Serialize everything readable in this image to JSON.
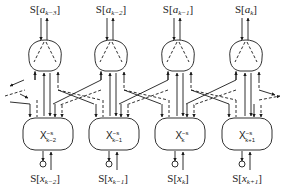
{
  "diagram": {
    "type": "factor-graph / message-passing chain",
    "top_nodes": [
      {
        "label_prefix": "S[",
        "var": "a",
        "sub": "k−3",
        "label_suffix": "]",
        "cx": 45
      },
      {
        "label_prefix": "S[",
        "var": "a",
        "sub": "k−2",
        "label_suffix": "]",
        "cx": 111
      },
      {
        "label_prefix": "S[",
        "var": "a",
        "sub": "k−1",
        "label_suffix": "]",
        "cx": 178
      },
      {
        "label_prefix": "S[",
        "var": "a",
        "sub": "k",
        "label_suffix": "]",
        "cx": 246
      }
    ],
    "bottom_nodes": [
      {
        "label_prefix": "S[",
        "var": "x",
        "sub": "k−2",
        "label_suffix": "]",
        "cx": 45,
        "box_main": "X",
        "box_sup": "−s",
        "box_sub": "k−2"
      },
      {
        "label_prefix": "S[",
        "var": "x",
        "sub": "k−1",
        "label_suffix": "]",
        "cx": 113,
        "box_main": "X",
        "box_sup": "−s",
        "box_sub": "k−1"
      },
      {
        "label_prefix": "S[",
        "var": "x",
        "sub": "k",
        "label_suffix": "]",
        "cx": 178,
        "box_main": "X",
        "box_sup": "−s",
        "box_sub": "k"
      },
      {
        "label_prefix": "S[",
        "var": "x",
        "sub": "k+1",
        "label_suffix": "]",
        "cx": 247,
        "box_main": "X",
        "box_sup": "−s",
        "box_sub": "k+1"
      }
    ],
    "colors": {
      "stroke": "#1a1a1a",
      "background": "#ffffff"
    }
  }
}
